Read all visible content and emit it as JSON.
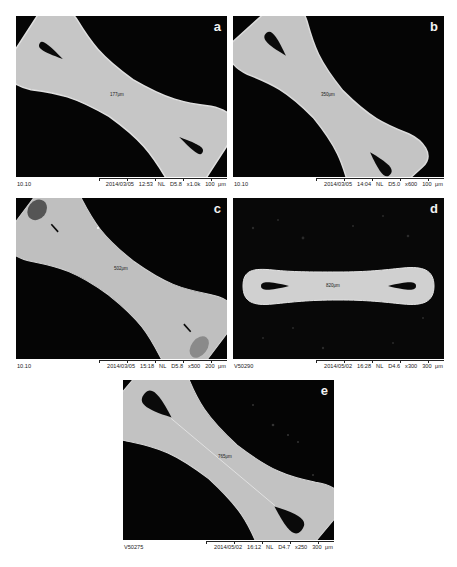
{
  "figure": {
    "panels": [
      {
        "letter": "a",
        "measurement": "177μm",
        "footer": {
          "id": "10.10",
          "date": "2014/03/05",
          "time": "12:53",
          "mode": "NL",
          "wd": "D5.8",
          "mag": "x1.0k",
          "scale": "100 μm"
        }
      },
      {
        "letter": "b",
        "measurement": "350μm",
        "footer": {
          "id": "10.10",
          "date": "2014/03/05",
          "time": "14:04",
          "mode": "NL",
          "wd": "D5.0",
          "mag": "x600",
          "scale": "100 μm"
        }
      },
      {
        "letter": "c",
        "measurement": "502μm",
        "footer": {
          "id": "10.10",
          "date": "2014/03/05",
          "time": "15:18",
          "mode": "NL",
          "wd": "D5.8",
          "mag": "x500",
          "scale": "200 μm"
        }
      },
      {
        "letter": "d",
        "measurement": "820μm",
        "footer": {
          "id": "V50290",
          "date": "2014/05/02",
          "time": "16:28",
          "mode": "NL",
          "wd": "D4.6",
          "mag": "x300",
          "scale": "300 μm"
        }
      },
      {
        "letter": "e",
        "measurement": "765μm",
        "footer": {
          "id": "V50275",
          "date": "2014/05/02",
          "time": "16:12",
          "mode": "NL",
          "wd": "D4.7",
          "mag": "x250",
          "scale": "300 μm"
        }
      }
    ],
    "colors": {
      "background": "#050505",
      "specimen": "#c4c4c4",
      "specimen_edge": "#dcdcdc",
      "hole": "#0a0a0a"
    }
  }
}
